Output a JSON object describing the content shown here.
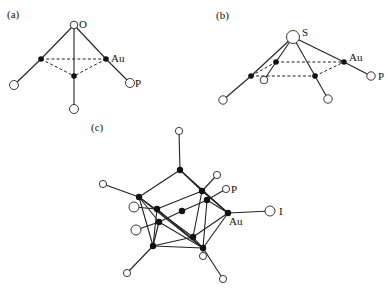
{
  "panels": {
    "a": {
      "label": "(a)",
      "atom_labels": {
        "O": "O",
        "Au": "Au",
        "P": "P"
      }
    },
    "b": {
      "label": "(b)",
      "atom_labels": {
        "S": "S",
        "Au": "Au",
        "P": "P"
      }
    },
    "c": {
      "label": "(c)",
      "atom_labels": {
        "P": "P",
        "Au": "Au",
        "I": "I"
      }
    }
  },
  "legend": {
    "filled_circle": "Au",
    "open_circle": "ligand atom (O, S, P, I)"
  }
}
